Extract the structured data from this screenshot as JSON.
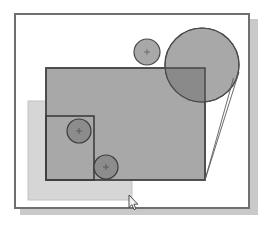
{
  "app": {
    "title": "Shape Canvas",
    "background_color": "#ffffff"
  },
  "canvas": {
    "name": "drawing-canvas",
    "x": 14,
    "y": 13,
    "width": 236,
    "height": 196,
    "fill": "#ffffff",
    "border_color": "#6f6f6f",
    "border_width": 2,
    "shadow_color": "#c9c9c9",
    "shadow_offset_x": 6,
    "shadow_offset_y": 6
  },
  "shapes": {
    "light_rectangle": {
      "label": "Light Rectangle",
      "x": 26,
      "y": 99,
      "width": 104,
      "height": 99,
      "fill": "#d6d6d6",
      "stroke": "#bdbdbd",
      "opacity": 1
    },
    "main_rectangle": {
      "label": "Main Rectangle",
      "x": 44,
      "y": 66,
      "width": 159,
      "height": 112,
      "fill": "#a8a8a8",
      "stroke": "#4a4a4a",
      "stroke_width": 1.5,
      "opacity": 1
    },
    "inner_rectangle": {
      "label": "Inner Rectangle",
      "x": 44,
      "y": 114,
      "width": 48,
      "height": 64,
      "fill": "none",
      "stroke": "#3c3c3c",
      "stroke_width": 1.5
    },
    "big_circle": {
      "label": "Large Circle",
      "cx": 200,
      "cy": 63,
      "r": 37,
      "fill": "#a8a8a8",
      "stroke": "#4a4a4a",
      "stroke_width": 1.2
    },
    "big_circle_overlap": {
      "label": "Circle / Rectangle Intersection",
      "fill": "#8a8a8a"
    },
    "small_top_circle": {
      "label": "Small Top Circle",
      "cx": 145,
      "cy": 50,
      "r": 13,
      "fill": "#a8a8a8",
      "stroke": "#4a4a4a",
      "stroke_width": 1.2,
      "center_mark": "crosshair"
    },
    "circle_upper_left": {
      "label": "Upper Left Circle",
      "cx": 77,
      "cy": 129,
      "r": 12,
      "fill": "#8c8c8c",
      "stroke": "#3c3c3c",
      "stroke_width": 1.2,
      "center_mark": "crosshair"
    },
    "circle_lower_left": {
      "label": "Lower Left Circle",
      "cx": 104,
      "cy": 165,
      "r": 12,
      "fill": "#8c8c8c",
      "stroke": "#3c3c3c",
      "stroke_width": 1.2,
      "center_mark": "crosshair"
    },
    "tangent_lines": {
      "label": "Tangent Guide Lines",
      "stroke": "#5a5a5a",
      "stroke_width": 0.9,
      "line_a": {
        "x1": 203,
        "y1": 178,
        "x2": 232,
        "y2": 76
      },
      "line_b": {
        "x1": 203,
        "y1": 178,
        "x2": 237,
        "y2": 70
      }
    }
  },
  "cursor": {
    "name": "mouse-pointer",
    "x": 128,
    "y": 195,
    "fill": "#f2f2f2",
    "stroke": "#3a3a3a"
  }
}
